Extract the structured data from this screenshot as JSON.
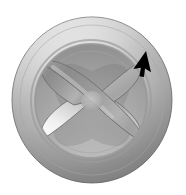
{
  "scene": {
    "title": "3D rendered X-shaped knob on circular disc",
    "background_color": "#ffffff",
    "canvas": {
      "width": 186,
      "height": 195
    }
  },
  "object": {
    "name": "cross-knob-disc",
    "description": "Grey metallic circular disc with recessed inner basin containing a four-lobed X-shaped cross blade",
    "outer_ring": {
      "label": "outer-torus-ring",
      "center_x": 92,
      "center_y": 100,
      "radius_x": 80,
      "radius_y": 83,
      "highlight_color": "#d9d9d9",
      "midtone_color": "#b4b4b4",
      "shadow_color": "#8e8e8e",
      "edge_color": "#7d7d7d"
    },
    "inner_basin": {
      "label": "recessed-inner-basin",
      "center_x": 91,
      "center_y": 101,
      "radius_x": 56,
      "radius_y": 57,
      "fill_color": "#a8a8a8",
      "rim_color": "#9a9a9a"
    },
    "cross_blade": {
      "label": "x-cross-blade",
      "arm_count": 4,
      "arm_length": 54,
      "arm_width": 22,
      "rotation_degrees": 45,
      "lit_color": "#f2f2f2",
      "mid_color": "#bdbdbd",
      "dark_color": "#808080",
      "outline_color": "#6e6e6e",
      "arms": [
        {
          "name": "arm-top-left",
          "angle": 225,
          "shading": "dark"
        },
        {
          "name": "arm-top-right",
          "angle": 315,
          "shading": "mid"
        },
        {
          "name": "arm-bottom-right",
          "angle": 45,
          "shading": "mid"
        },
        {
          "name": "arm-bottom-left",
          "angle": 135,
          "shading": "lit"
        }
      ]
    }
  },
  "cursor": {
    "name": "mouse-pointer",
    "glyph": "arrow",
    "color": "#000000",
    "tip_x": 146,
    "tip_y": 51,
    "rotation_degrees": 35
  }
}
